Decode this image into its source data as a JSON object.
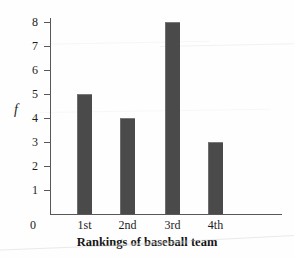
{
  "chart_data": {
    "type": "bar",
    "title": "",
    "xlabel": "Rankings of baseball team",
    "ylabel": "f",
    "categories": [
      "1st",
      "2nd",
      "3rd",
      "4th"
    ],
    "values": [
      5,
      4,
      8,
      3
    ],
    "ylim": [
      0,
      8
    ],
    "y_ticks": [
      8,
      7,
      6,
      5,
      4,
      3,
      2,
      1,
      0
    ],
    "y_tick_labels": [
      "8",
      "7",
      "6",
      "5",
      "4",
      "3",
      "2",
      "1",
      "0"
    ],
    "grid": false,
    "legend": null,
    "bar_color": "#4a4a4a",
    "axis_color": "#585858",
    "background_color": "#fefefe"
  },
  "axes": {
    "origin_label": "0",
    "y_axis_title": "f",
    "x_axis_title": "Rankings of baseball team"
  },
  "bars": [
    {
      "category": "1st",
      "value": 5,
      "value_label": "5"
    },
    {
      "category": "2nd",
      "value": 4,
      "value_label": "4"
    },
    {
      "category": "3rd",
      "value": 8,
      "value_label": "8"
    },
    {
      "category": "4th",
      "value": 3,
      "value_label": "3"
    }
  ],
  "y_ticks": [
    {
      "label": "8",
      "value": 8
    },
    {
      "label": "7",
      "value": 7
    },
    {
      "label": "6",
      "value": 6
    },
    {
      "label": "5",
      "value": 5
    },
    {
      "label": "4",
      "value": 4
    },
    {
      "label": "3",
      "value": 3
    },
    {
      "label": "2",
      "value": 2
    },
    {
      "label": "1",
      "value": 1
    }
  ]
}
